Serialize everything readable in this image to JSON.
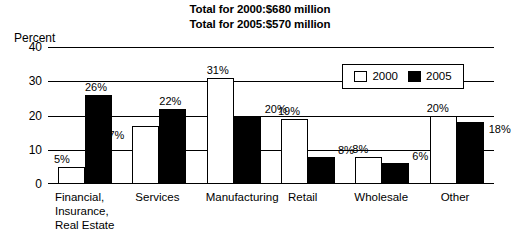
{
  "titles": {
    "line1": "Total for 2000:$680 million",
    "line2": "Total for 2005:$570 million"
  },
  "axis": {
    "y_title": "Percent"
  },
  "legend": {
    "entries": [
      {
        "label": "2000",
        "swatch": "white-square-icon"
      },
      {
        "label": "2005",
        "swatch": "black-square-icon"
      }
    ]
  },
  "chart_data": {
    "type": "bar",
    "xlabel": "",
    "ylabel": "Percent",
    "ylim": [
      0,
      40
    ],
    "yticks": [
      "0",
      "10",
      "20",
      "30",
      "40"
    ],
    "grid": true,
    "legend_position": "upper-right-inside",
    "categories": [
      "Financial,\nInsurance,\nReal Estate",
      "Services",
      "Manufacturing",
      "Retail",
      "Wholesale",
      "Other"
    ],
    "series": [
      {
        "name": "2000",
        "color": "#ffffff",
        "values": [
          5,
          17,
          31,
          19,
          8,
          20
        ],
        "labels": [
          "5%",
          "17%",
          "31%",
          "19%",
          "8%",
          "20%"
        ]
      },
      {
        "name": "2005",
        "color": "#000000",
        "values": [
          26,
          22,
          20,
          8,
          6,
          18
        ],
        "labels": [
          "26%",
          "22%",
          "20%",
          "8%",
          "6%",
          "18%"
        ]
      }
    ]
  }
}
